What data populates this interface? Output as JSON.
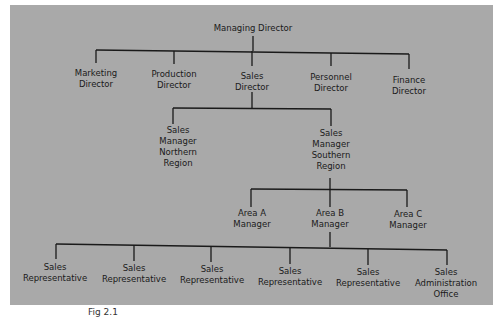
{
  "chart_data": {
    "type": "org-chart",
    "title": "",
    "nodes": [
      {
        "id": "md",
        "label": "Managing Director",
        "parent": null
      },
      {
        "id": "mkt",
        "label": "Marketing Director",
        "parent": "md"
      },
      {
        "id": "prod",
        "label": "Production Director",
        "parent": "md"
      },
      {
        "id": "sales",
        "label": "Sales Director",
        "parent": "md"
      },
      {
        "id": "pers",
        "label": "Personnel Director",
        "parent": "md"
      },
      {
        "id": "fin",
        "label": "Finance Director",
        "parent": "md"
      },
      {
        "id": "smn",
        "label": "Sales Manager Northern Region",
        "parent": "sales"
      },
      {
        "id": "sms",
        "label": "Sales Manager Southern Region",
        "parent": "sales"
      },
      {
        "id": "aa",
        "label": "Area A Manager",
        "parent": "sms"
      },
      {
        "id": "ab",
        "label": "Area B Manager",
        "parent": "sms"
      },
      {
        "id": "ac",
        "label": "Area C Manager",
        "parent": "sms"
      },
      {
        "id": "r1",
        "label": "Sales Representative",
        "parent": "ab"
      },
      {
        "id": "r2",
        "label": "Sales Representative",
        "parent": "ab"
      },
      {
        "id": "r3",
        "label": "Sales Representative",
        "parent": "ab"
      },
      {
        "id": "r4",
        "label": "Sales Representative",
        "parent": "ab"
      },
      {
        "id": "r5",
        "label": "Sales Representative",
        "parent": "ab"
      },
      {
        "id": "sao",
        "label": "Sales Administration Office",
        "parent": "ab"
      }
    ]
  },
  "labels": {
    "md": [
      "Managing Director"
    ],
    "mkt": [
      "Marketing",
      "Director"
    ],
    "prod": [
      "Production",
      "Director"
    ],
    "sales": [
      "Sales",
      "Director"
    ],
    "pers": [
      "Personnel",
      "Director"
    ],
    "fin": [
      "Finance",
      "Director"
    ],
    "smn": [
      "Sales",
      "Manager",
      "Northern",
      "Region"
    ],
    "sms": [
      "Sales",
      "Manager",
      "Southern",
      "Region"
    ],
    "aa": [
      "Area A",
      "Manager"
    ],
    "ab": [
      "Area B",
      "Manager"
    ],
    "ac": [
      "Area C",
      "Manager"
    ],
    "r1": [
      "Sales",
      "Representative"
    ],
    "r2": [
      "Sales",
      "Representative"
    ],
    "r3": [
      "Sales",
      "Representative"
    ],
    "r4": [
      "Sales",
      "Representative"
    ],
    "r5": [
      "Sales",
      "Representative"
    ],
    "sao": [
      "Sales",
      "Administration",
      "Office"
    ]
  },
  "caption": "Fig 2.1"
}
